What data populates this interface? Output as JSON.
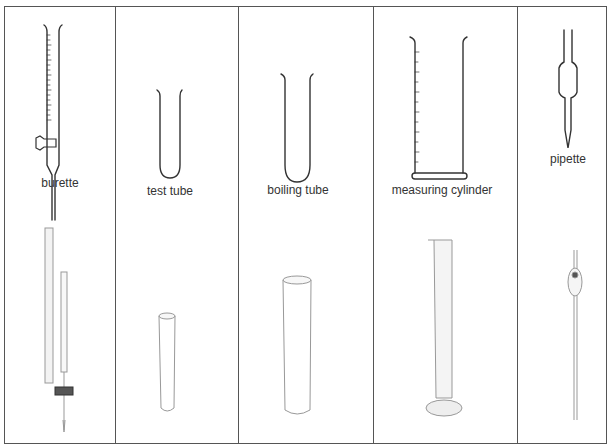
{
  "columns": [
    {
      "id": "burette",
      "label": "burette"
    },
    {
      "id": "test-tube",
      "label": "test tube"
    },
    {
      "id": "boiling-tube",
      "label": "boiling tube"
    },
    {
      "id": "measuring-cylinder",
      "label": "measuring cylinder"
    },
    {
      "id": "pipette",
      "label": "pipette"
    }
  ],
  "colors": {
    "line": "#333333",
    "border": "#555555",
    "glass": "#cfcfcf"
  }
}
